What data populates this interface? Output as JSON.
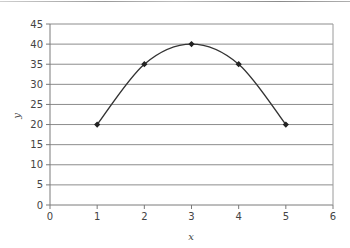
{
  "chart_data": {
    "type": "line",
    "title": "",
    "xlabel": "x",
    "ylabel": "y",
    "x": [
      1,
      2,
      3,
      4,
      5
    ],
    "series": [
      {
        "name": "y",
        "values": [
          20,
          35,
          40,
          35,
          20
        ],
        "smooth": true,
        "markers": true,
        "color": "#333333"
      }
    ],
    "xlim": [
      0,
      6
    ],
    "ylim": [
      0,
      45
    ],
    "xticks": [
      0,
      1,
      2,
      3,
      4,
      5,
      6
    ],
    "yticks": [
      0,
      5,
      10,
      15,
      20,
      25,
      30,
      35,
      40,
      45
    ],
    "grid": {
      "horizontal": true,
      "vertical": false,
      "color": "#8c8c8c"
    },
    "legend": null
  },
  "axes": {
    "xlabel": "x",
    "ylabel": "y",
    "xtick_labels": [
      "0",
      "1",
      "2",
      "3",
      "4",
      "5",
      "6"
    ],
    "ytick_labels": [
      "0",
      "5",
      "10",
      "15",
      "20",
      "25",
      "30",
      "35",
      "40",
      "45"
    ]
  }
}
